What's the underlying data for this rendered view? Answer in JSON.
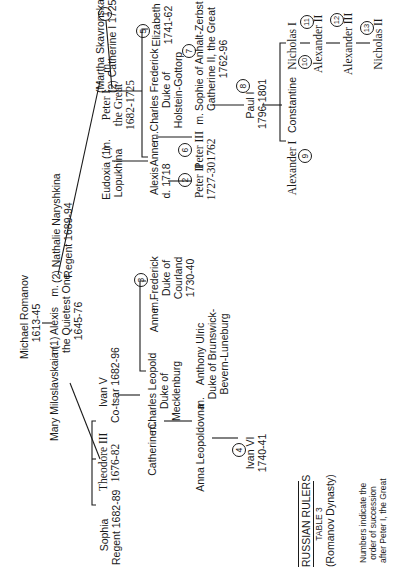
{
  "chart_title": "RUSSIAN RULERS",
  "legend": {
    "title": "RUSSIAN RULERS",
    "table": "TABLE 3",
    "dynasty": "(Romanov Dynasty)",
    "note_lines": [
      "Numbers indicate the",
      "order of succession",
      "after Peter I, the Great"
    ]
  },
  "people": {
    "michael": [
      "Michael Romanov",
      "1613-45"
    ],
    "alexis": [
      "Alexis",
      "the Quietest One",
      "1645-76"
    ],
    "mary": "Mary Miloslavskaia (1)",
    "nathalie": [
      "(2) Nathalie Naryshkina",
      "Regent 1689-94"
    ],
    "sophia": [
      "Sophia",
      "Regent 1682-89"
    ],
    "theodore": [
      "Theodore III",
      "1676-82"
    ],
    "ivan5": [
      "Ivan V",
      "Co-tsar 1682-96"
    ],
    "eudoxia": [
      "Eudoxia (1)",
      "Lopukhina"
    ],
    "peter1": [
      "Peter I",
      "the Great",
      "1682-1725"
    ],
    "catherine1": [
      "(Martha Skavronska)",
      "(2) Catherine I  1725-27"
    ],
    "alexis_son": [
      "Alexis",
      "d. 1718"
    ],
    "peter2": [
      "Peter II",
      "1727-30"
    ],
    "anne_p": "Anne",
    "charles_frederick": [
      "Charles Frederick",
      "Duke of",
      "Holstein-Gottorp"
    ],
    "elizabeth": [
      "Elizabeth",
      "1741-62"
    ],
    "peter3": [
      "Peter III",
      "1762"
    ],
    "sophie": [
      "Sophie of Anhalt-Zerbst",
      "Catherine II, the Great",
      "1762-96"
    ],
    "paul1": [
      "Paul I",
      "1796-1801"
    ],
    "alexander1": "Alexander I",
    "constantine": "Constantine",
    "nicholas1": "Nicholas I",
    "alexander2": "Alexander II",
    "alexander3": "Alexander III",
    "nicholas2": "Nicholas II",
    "anne_i": "Anne",
    "frederick": [
      "Frederick",
      "Duke of",
      "Courland",
      "1730-40"
    ],
    "catherine_i": "Catherine",
    "charles_leopold": [
      "Charles Leopold",
      "Duke of",
      "Mecklenburg"
    ],
    "anna_leopoldovna": "Anna Leopoldovna",
    "anthony_ulric": [
      "Anthony Ulric",
      "Duke of Brunswick-",
      "Bevern-Luneburg"
    ],
    "ivan6": [
      "Ivan VI",
      "1740-41"
    ]
  },
  "marriage_symbol": "m.",
  "succession_numbers": {
    "catherine1": "1",
    "peter2": "2",
    "anne_i": "3",
    "ivan6": "4",
    "elizabeth": "5",
    "peter3": "6",
    "catherine2": "7",
    "paul1": "8",
    "alexander1": "9",
    "nicholas1": "10",
    "alexander2": "11",
    "alexander3": "12",
    "nicholas2": "13"
  }
}
